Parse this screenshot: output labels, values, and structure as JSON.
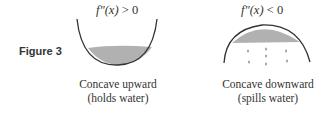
{
  "figure": {
    "label": "Figure 3"
  },
  "panels": [
    {
      "condition_fn": "f″(x)",
      "condition_op": ">",
      "condition_val": "0",
      "caption_line1": "Concave upward",
      "caption_line2": "(holds water)"
    },
    {
      "condition_fn": "f″(x)",
      "condition_op": "<",
      "condition_val": "0",
      "caption_line1": "Concave downward",
      "caption_line2": "(spills water)"
    }
  ],
  "colors": {
    "curve": "#333333",
    "water": "#a8a8a8"
  }
}
